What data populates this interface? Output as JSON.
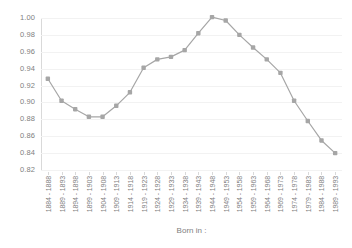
{
  "chart_data": {
    "type": "line",
    "title": "",
    "subtitle": "",
    "xlabel": "Born in :",
    "ylabel": "",
    "ylim": [
      0.82,
      1.0
    ],
    "ytick_step": 0.02,
    "grid": true,
    "legend": false,
    "legend_position": "none",
    "marker": "square",
    "series_color": "#a6a6a6",
    "categories": [
      "1884 - 1888",
      "1889 - 1893",
      "1894 - 1898",
      "1899 - 1903",
      "1904 - 1908",
      "1909 - 1913",
      "1914 - 1918",
      "1919 - 1923",
      "1924 - 1928",
      "1929 - 1933",
      "1934 - 1938",
      "1939 - 1943",
      "1944 - 1948",
      "1949 - 1953",
      "1954 - 1958",
      "1959 - 1963",
      "1964 - 1968",
      "1969 - 1973",
      "1974 - 1978",
      "1979 - 1983",
      "1984 - 1988",
      "1989 - 1993"
    ],
    "values": [
      0.928,
      0.902,
      0.892,
      0.883,
      0.883,
      0.896,
      0.912,
      0.941,
      0.951,
      0.954,
      0.962,
      0.982,
      1.001,
      0.997,
      0.98,
      0.965,
      0.951,
      0.935,
      0.902,
      0.878,
      0.855,
      0.84
    ],
    "ytick_labels": [
      "1.00",
      "0.98",
      "0.96",
      "0.94",
      "0.92",
      "0.90",
      "0.88",
      "0.86",
      "0.84",
      "0.82"
    ],
    "ytick_values": [
      1.0,
      0.98,
      0.96,
      0.94,
      0.92,
      0.9,
      0.88,
      0.86,
      0.84,
      0.82
    ]
  },
  "colors": {
    "series": "#a6a6a6",
    "axis": "#d9d9d9",
    "grid": "#f2f2f2",
    "text": "#808080",
    "background": "#ffffff"
  }
}
